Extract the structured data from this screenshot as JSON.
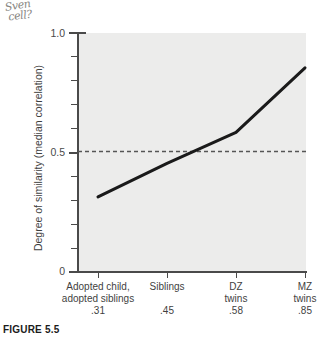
{
  "annotation": {
    "name": "handwritten-note",
    "line1": "Sven",
    "line2": "cell?"
  },
  "caption": {
    "text": "FIGURE 5.5"
  },
  "chart_data": {
    "type": "line",
    "title": "",
    "xlabel": "",
    "ylabel": "Degree of similarity (median correlation)",
    "categories": [
      "Adopted child,\nadopted siblings",
      "Siblings",
      "DZ\ntwins",
      "MZ\ntwins"
    ],
    "value_labels": [
      ".31",
      ".45",
      ".58",
      ".85"
    ],
    "values": [
      0.31,
      0.45,
      0.58,
      0.85
    ],
    "ylim": [
      0,
      1.0
    ],
    "ytick_labels": [
      "0",
      "0.5",
      "1.0"
    ],
    "ytick_values": [
      0,
      0.5,
      1.0
    ],
    "yminor_values": [
      0.1,
      0.2,
      0.3,
      0.4,
      0.6,
      0.7,
      0.8,
      0.9
    ],
    "grid": false,
    "legend": "none",
    "reference_line": {
      "value": 0.5,
      "style": "dashed",
      "color": "#555555"
    },
    "line_color": "#1a1a1a",
    "plot_background": "#ececeb"
  }
}
